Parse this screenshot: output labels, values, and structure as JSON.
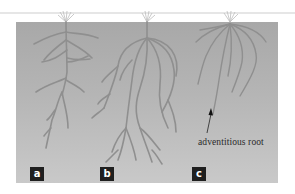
{
  "diagram": {
    "panels": [
      {
        "id": "a",
        "label": "a",
        "description": "taproot system with lateral branches"
      },
      {
        "id": "b",
        "label": "b",
        "description": "densely branched root system"
      },
      {
        "id": "c",
        "label": "c",
        "description": "fibrous root system with adventitious roots"
      }
    ],
    "annotations": [
      {
        "text": "adventitious root",
        "points_to": "c",
        "arrow": "up"
      }
    ],
    "colors": {
      "background_panel": "#b0b0b0",
      "roots": "#8e8e8e",
      "label_box": "#1f1f1f",
      "label_text": "#ffffff",
      "annotation_text": "#2a2a2a"
    }
  }
}
